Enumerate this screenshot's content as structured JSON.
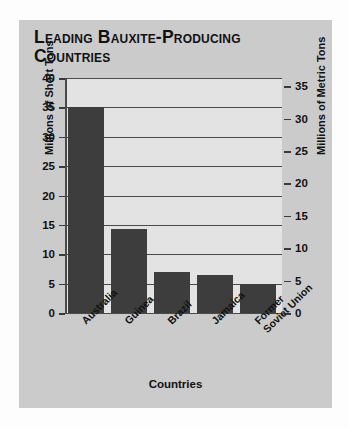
{
  "chart_data": {
    "type": "bar",
    "title": "Leading Bauxite-Producing Countries",
    "categories": [
      "Australia",
      "Guinea",
      "Brazil",
      "Jamaica",
      "Former Soviet Union"
    ],
    "values": [
      35.0,
      14.3,
      6.9,
      6.5,
      4.9
    ],
    "series": [
      {
        "name": "Millions of Short Tons",
        "values": [
          35.0,
          14.3,
          6.9,
          6.5,
          4.9
        ]
      }
    ],
    "xlabel": "Countries",
    "ylabel": "Millions of Short Tons",
    "ylabel_right": "Millions of Metric Tons",
    "ylim": [
      0,
      40
    ],
    "ylim_right": [
      0,
      36.29
    ],
    "yticks": [
      0,
      5,
      10,
      15,
      20,
      25,
      30,
      35,
      40
    ],
    "yticks_right": [
      0,
      5,
      10,
      15,
      20,
      25,
      30,
      35
    ],
    "ytick_labels": [
      "0",
      "5",
      "10",
      "15",
      "20",
      "25",
      "30",
      "35",
      "40"
    ],
    "ytick_labels_right": [
      "0",
      "5",
      "10",
      "15",
      "20",
      "25",
      "30",
      "35"
    ],
    "grid": true,
    "legend": false,
    "bar_color": "#3d3d3d",
    "plot_background": "#e3e3e3",
    "panel_background": "#cbcbcb",
    "axis_color": "#4a4a4a",
    "text_color": "#111111"
  }
}
